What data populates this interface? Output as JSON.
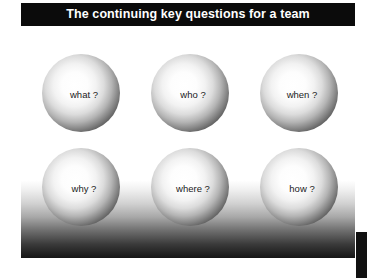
{
  "slide": {
    "title": "The continuing key questions for a team",
    "colors": {
      "title_bar_bg": "#0b0b0b",
      "title_text": "#ffffff",
      "panel_top": "#ffffff",
      "panel_bottom": "#161616",
      "sphere_highlight": "#ffffff",
      "sphere_edge": "#070707",
      "sphere_label_text": "#1a1a1a",
      "right_strip": "#111111"
    },
    "spheres": [
      {
        "label": "what ?"
      },
      {
        "label": "who ?"
      },
      {
        "label": "when ?"
      },
      {
        "label": "why ?"
      },
      {
        "label": "where ?"
      },
      {
        "label": "how ?"
      }
    ]
  }
}
